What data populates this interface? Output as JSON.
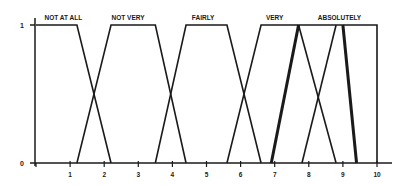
{
  "chart_data": {
    "type": "line",
    "title": "",
    "xlabel": "",
    "ylabel": "",
    "xlim": [
      0,
      10
    ],
    "ylim": [
      0,
      1
    ],
    "x_ticks": [
      "1",
      "2",
      "3",
      "4",
      "5",
      "6",
      "7",
      "8",
      "9",
      "10"
    ],
    "y_ticks": [
      "0",
      "1"
    ],
    "grid": false,
    "legend": "none",
    "series": [
      {
        "name": "NOT AT ALL",
        "points": [
          [
            0,
            1
          ],
          [
            1.2,
            1
          ],
          [
            2.2,
            0
          ]
        ],
        "thick": false
      },
      {
        "name": "NOT VERY",
        "points": [
          [
            1.2,
            0
          ],
          [
            2.2,
            1
          ],
          [
            3.5,
            1
          ],
          [
            4.4,
            0
          ]
        ],
        "thick": false
      },
      {
        "name": "FAIRLY",
        "points": [
          [
            3.5,
            0
          ],
          [
            4.4,
            1
          ],
          [
            5.6,
            1
          ],
          [
            6.6,
            0
          ]
        ],
        "thick": false
      },
      {
        "name": "VERY",
        "points": [
          [
            5.6,
            0
          ],
          [
            6.6,
            1
          ],
          [
            10,
            1
          ],
          [
            10,
            0
          ]
        ],
        "thick": false
      },
      {
        "name": "VERY (hedge, thick)",
        "points": [
          [
            6.9,
            0
          ],
          [
            7.7,
            1
          ]
        ],
        "thick": true
      },
      {
        "name": "VERY (fall)",
        "points": [
          [
            7.7,
            1
          ],
          [
            8.8,
            0
          ]
        ],
        "thick": false
      },
      {
        "name": "ABSOLUTELY",
        "points": [
          [
            7.8,
            0
          ],
          [
            8.8,
            1
          ]
        ],
        "thick": false
      },
      {
        "name": "ABSOLUTELY (hedge, thick)",
        "points": [
          [
            9.0,
            1
          ],
          [
            9.4,
            0
          ]
        ],
        "thick": true
      }
    ],
    "annotations": [
      {
        "text": "NOT AT ALL",
        "x": 0.8
      },
      {
        "text": "NOT VERY",
        "x": 2.7
      },
      {
        "text": "FAIRLY",
        "x": 4.9
      },
      {
        "text": "VERY",
        "x": 7.0
      },
      {
        "text": "ABSOLUTELY",
        "x": 8.9
      }
    ]
  }
}
